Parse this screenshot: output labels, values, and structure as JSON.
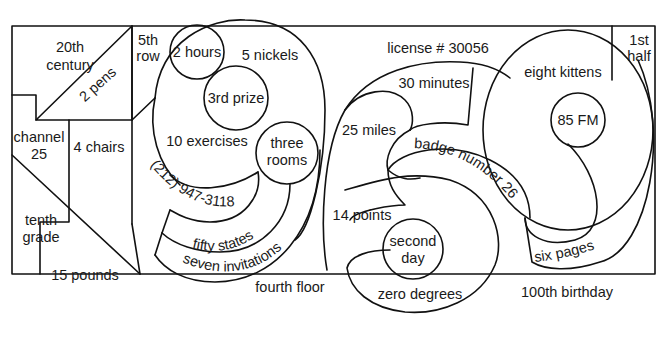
{
  "diagram": {
    "type": "region-puzzle",
    "regions": [
      {
        "id": "twentieth-century",
        "lines": [
          "20th",
          "century"
        ]
      },
      {
        "id": "two-pens",
        "lines": [
          "2 pens"
        ]
      },
      {
        "id": "fifth-row",
        "lines": [
          "5th",
          "row"
        ]
      },
      {
        "id": "channel-25",
        "lines": [
          "channel",
          "25"
        ]
      },
      {
        "id": "four-chairs",
        "lines": [
          "4 chairs"
        ]
      },
      {
        "id": "tenth-grade",
        "lines": [
          "tenth",
          "grade"
        ]
      },
      {
        "id": "fifteen-pounds",
        "lines": [
          "15 pounds"
        ]
      },
      {
        "id": "two-hours",
        "lines": [
          "2 hours"
        ]
      },
      {
        "id": "five-nickels",
        "lines": [
          "5 nickels"
        ]
      },
      {
        "id": "third-prize",
        "lines": [
          "3rd prize"
        ]
      },
      {
        "id": "ten-exercises",
        "lines": [
          "10 exercises"
        ]
      },
      {
        "id": "three-rooms",
        "lines": [
          "three",
          "rooms"
        ]
      },
      {
        "id": "phone-number",
        "lines": [
          "(212) 947-3118"
        ]
      },
      {
        "id": "fifty-states",
        "lines": [
          "fifty states"
        ]
      },
      {
        "id": "seven-invitations",
        "lines": [
          "seven invitations"
        ]
      },
      {
        "id": "fourth-floor",
        "lines": [
          "fourth floor"
        ]
      },
      {
        "id": "license",
        "lines": [
          "license # 30056"
        ]
      },
      {
        "id": "thirty-minutes",
        "lines": [
          "30 minutes"
        ]
      },
      {
        "id": "twenty-five-miles",
        "lines": [
          "25 miles"
        ]
      },
      {
        "id": "badge-number",
        "lines": [
          "badge number 26"
        ]
      },
      {
        "id": "fourteen-points",
        "lines": [
          "14 points"
        ]
      },
      {
        "id": "second-day",
        "lines": [
          "second",
          "day"
        ]
      },
      {
        "id": "zero-degrees",
        "lines": [
          "zero degrees"
        ]
      },
      {
        "id": "eight-kittens",
        "lines": [
          "eight kittens"
        ]
      },
      {
        "id": "eighty-five-fm",
        "lines": [
          "85 FM"
        ]
      },
      {
        "id": "first-half",
        "lines": [
          "1st",
          "half"
        ]
      },
      {
        "id": "six-pages",
        "lines": [
          "six pages"
        ]
      },
      {
        "id": "hundredth-birthday",
        "lines": [
          "100th birthday"
        ]
      }
    ]
  },
  "colors": {
    "line": "#111111",
    "text": "#1a1a1a",
    "background": "#ffffff"
  }
}
